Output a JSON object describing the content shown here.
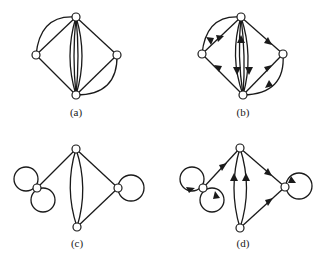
{
  "figure": {
    "colors": {
      "ink": "#1a1a1a",
      "background": "#ffffff"
    },
    "panels": [
      {
        "id": "a",
        "label": "(a)",
        "directed": false,
        "nodes": [
          {
            "id": "top",
            "x": 76,
            "y": 17
          },
          {
            "id": "left",
            "x": 36,
            "y": 55
          },
          {
            "id": "right",
            "x": 117,
            "y": 55
          },
          {
            "id": "bottom",
            "x": 76,
            "y": 95
          }
        ],
        "edges": [
          "top-left (straight)",
          "top-left (arc)",
          "top-right (straight)",
          "left-bottom (straight)",
          "right-bottom (straight)",
          "right-bottom (arc)",
          "top-bottom x4 (parallel lens)"
        ]
      },
      {
        "id": "b",
        "label": "(b)",
        "directed": true,
        "nodes": [
          {
            "id": "top",
            "x": 241,
            "y": 17
          },
          {
            "id": "left",
            "x": 202,
            "y": 54
          },
          {
            "id": "right",
            "x": 283,
            "y": 54
          },
          {
            "id": "bottom",
            "x": 243,
            "y": 95
          }
        ],
        "edges": [
          "top->left (straight)",
          "top->left (arc)",
          "top->right",
          "bottom->left",
          "bottom->right (straight)",
          "right->bottom (arc)",
          "top->bottom (outer-left)",
          "bottom->top (inner-left)",
          "top->bottom (inner-right)",
          "top->bottom (outer-right)"
        ]
      },
      {
        "id": "c",
        "label": "(c)",
        "directed": false,
        "nodes": [
          {
            "id": "left",
            "x": 37,
            "y": 188
          },
          {
            "id": "top",
            "x": 76,
            "y": 149
          },
          {
            "id": "right",
            "x": 118,
            "y": 188
          },
          {
            "id": "bottom",
            "x": 77,
            "y": 227
          }
        ],
        "edges": [
          "left loop (upper)",
          "left loop (lower)",
          "left-top",
          "top-right",
          "bottom-right",
          "top-bottom x2 (lens)",
          "right loop"
        ]
      },
      {
        "id": "d",
        "label": "(d)",
        "directed": true,
        "nodes": [
          {
            "id": "left",
            "x": 203,
            "y": 188
          },
          {
            "id": "top",
            "x": 240,
            "y": 148
          },
          {
            "id": "right",
            "x": 285,
            "y": 187
          },
          {
            "id": "bottom",
            "x": 240,
            "y": 228
          }
        ],
        "edges": [
          "left loop (upper)",
          "left loop (lower)",
          "left->top",
          "top->right",
          "bottom->right",
          "bottom->top x2 (lens)",
          "right loop"
        ]
      }
    ]
  }
}
